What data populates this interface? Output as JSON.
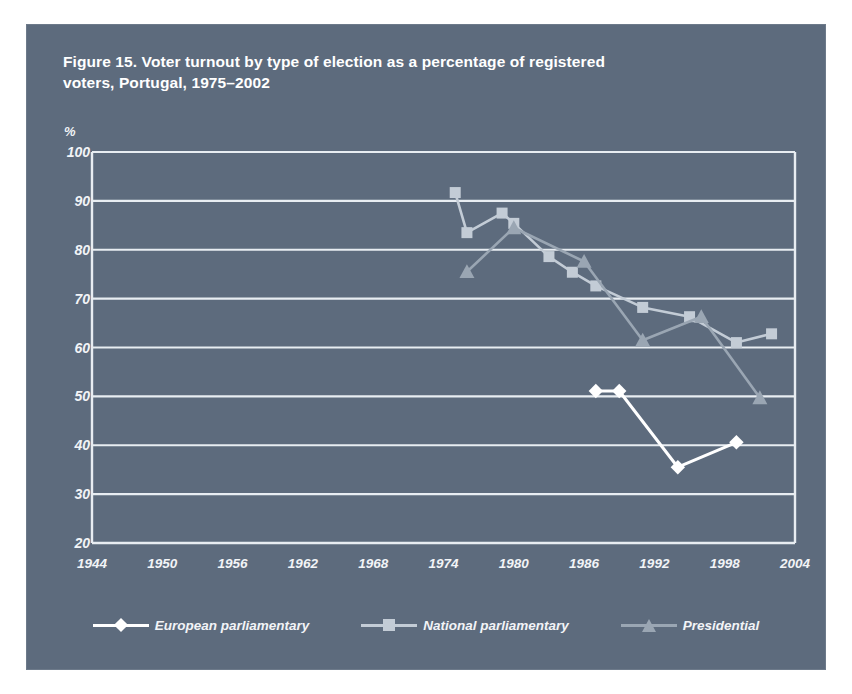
{
  "figure": {
    "title": "Figure 15. Voter turnout by type of election as a percentage of registered voters, Portugal, 1975–2002",
    "panel_color": "#5d6b7d",
    "text_color": "#f2f4f7",
    "gridline_color": "#e8edf2"
  },
  "chart_data": {
    "type": "line",
    "title": "Figure 15. Voter turnout by type of election as a percentage of registered voters, Portugal, 1975–2002",
    "xlabel": "",
    "ylabel": "%",
    "unit": "%",
    "xlim": [
      1944,
      2004
    ],
    "ylim": [
      20,
      100
    ],
    "xticks": [
      1944,
      1950,
      1956,
      1962,
      1968,
      1974,
      1980,
      1986,
      1992,
      1998,
      2004
    ],
    "yticks": [
      20,
      30,
      40,
      50,
      60,
      70,
      80,
      90,
      100
    ],
    "grid": "horizontal",
    "legend_position": "bottom",
    "series": [
      {
        "name": "European parliamentary",
        "marker": "diamond",
        "color": "#ffffff",
        "line_color": "#ffffff",
        "points": [
          {
            "x": 1987,
            "y": 51.1
          },
          {
            "x": 1989,
            "y": 51.1
          },
          {
            "x": 1994,
            "y": 35.5
          },
          {
            "x": 1999,
            "y": 40.6
          }
        ]
      },
      {
        "name": "National parliamentary",
        "marker": "square",
        "color": "#c3ccd6",
        "line_color": "#c3ccd6",
        "points": [
          {
            "x": 1975,
            "y": 91.7
          },
          {
            "x": 1976,
            "y": 83.5
          },
          {
            "x": 1979,
            "y": 87.5
          },
          {
            "x": 1980,
            "y": 85.4
          },
          {
            "x": 1983,
            "y": 78.6
          },
          {
            "x": 1985,
            "y": 75.4
          },
          {
            "x": 1987,
            "y": 72.6
          },
          {
            "x": 1991,
            "y": 68.2
          },
          {
            "x": 1995,
            "y": 66.3
          },
          {
            "x": 1999,
            "y": 61.0
          },
          {
            "x": 2002,
            "y": 62.8
          }
        ]
      },
      {
        "name": "Presidential",
        "marker": "triangle",
        "color": "#9aa6b3",
        "line_color": "#9aa6b3",
        "points": [
          {
            "x": 1976,
            "y": 75.5
          },
          {
            "x": 1980,
            "y": 84.5
          },
          {
            "x": 1986,
            "y": 77.6
          },
          {
            "x": 1991,
            "y": 61.5
          },
          {
            "x": 1996,
            "y": 66.3
          },
          {
            "x": 2001,
            "y": 49.7
          }
        ]
      }
    ]
  },
  "legend": [
    {
      "label": "European parliamentary",
      "marker": "diamond-marker",
      "color": "#ffffff"
    },
    {
      "label": "National parliamentary",
      "marker": "square-marker",
      "color": "#c3ccd6"
    },
    {
      "label": "Presidential",
      "marker": "triangle-marker",
      "color": "#9aa6b3"
    }
  ]
}
